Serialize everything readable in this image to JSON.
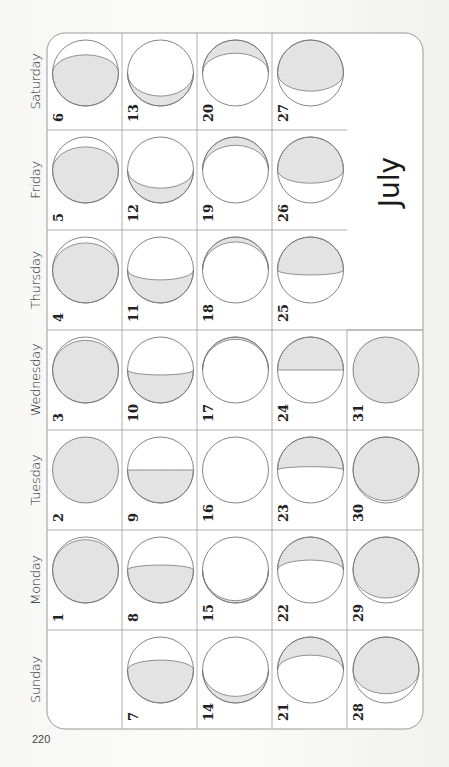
{
  "calendar": {
    "month": "July",
    "page_number": "220",
    "orientation": "rotated-90-ccw",
    "weekdays": [
      "Sunday",
      "Monday",
      "Tuesday",
      "Wednesday",
      "Thursday",
      "Friday",
      "Saturday"
    ],
    "first_weekday_index": 1,
    "days_in_month": 31,
    "colors": {
      "grid_line": "#9a9a9a",
      "moon_outline": "#777777",
      "moon_shade": "#e3e3e3",
      "cell_bg": "#ffffff",
      "text": "#222222"
    },
    "moon_phases": [
      {
        "day": 1,
        "shade": "bottom",
        "t": -0.92
      },
      {
        "day": 2,
        "shade": "bottom",
        "t": -1.0
      },
      {
        "day": 3,
        "shade": "bottom",
        "t": -0.9
      },
      {
        "day": 4,
        "shade": "bottom",
        "t": -0.82
      },
      {
        "day": 5,
        "shade": "bottom",
        "t": -0.7
      },
      {
        "day": 6,
        "shade": "bottom",
        "t": -0.55
      },
      {
        "day": 7,
        "shade": "bottom",
        "t": -0.3
      },
      {
        "day": 8,
        "shade": "bottom",
        "t": -0.15
      },
      {
        "day": 9,
        "shade": "bottom",
        "t": 0.0
      },
      {
        "day": 10,
        "shade": "bottom",
        "t": 0.15
      },
      {
        "day": 11,
        "shade": "bottom",
        "t": 0.3
      },
      {
        "day": 12,
        "shade": "bottom",
        "t": 0.55
      },
      {
        "day": 13,
        "shade": "bottom",
        "t": 0.7
      },
      {
        "day": 14,
        "shade": "bottom",
        "t": 0.8
      },
      {
        "day": 15,
        "shade": "bottom",
        "t": 0.93
      },
      {
        "day": 16,
        "shade": "none",
        "t": 1.0
      },
      {
        "day": 17,
        "shade": "top",
        "t": -0.93
      },
      {
        "day": 18,
        "shade": "top",
        "t": -0.85
      },
      {
        "day": 19,
        "shade": "top",
        "t": -0.75
      },
      {
        "day": 20,
        "shade": "top",
        "t": -0.6
      },
      {
        "day": 21,
        "shade": "top",
        "t": -0.45
      },
      {
        "day": 22,
        "shade": "top",
        "t": -0.3
      },
      {
        "day": 23,
        "shade": "top",
        "t": -0.1
      },
      {
        "day": 24,
        "shade": "top",
        "t": 0.0
      },
      {
        "day": 25,
        "shade": "top",
        "t": 0.15
      },
      {
        "day": 26,
        "shade": "top",
        "t": 0.4
      },
      {
        "day": 27,
        "shade": "top",
        "t": 0.55
      },
      {
        "day": 28,
        "shade": "top",
        "t": 0.72
      },
      {
        "day": 29,
        "shade": "top",
        "t": 0.85
      },
      {
        "day": 30,
        "shade": "top",
        "t": 0.93
      },
      {
        "day": 31,
        "shade": "top",
        "t": 1.0
      }
    ]
  }
}
